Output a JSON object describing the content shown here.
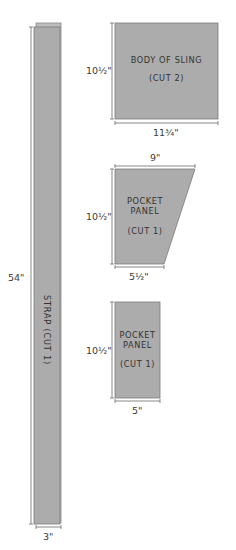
{
  "pieces": {
    "strap": {
      "label": "STRAP (CUT 1)",
      "length": "54\"",
      "width": "3\""
    },
    "body_of_sling": {
      "label_line1": "BODY OF SLING",
      "label_line2": "(CUT 2)",
      "height": "10½\"",
      "width": "11¾\""
    },
    "pocket_panel_trapezoid": {
      "label_line1": "POCKET",
      "label_line2": "PANEL",
      "label_line3": "(CUT 1)",
      "height": "10½\"",
      "top_width": "9\"",
      "bottom_width": "5½\""
    },
    "pocket_panel_rect": {
      "label_line1": "POCKET",
      "label_line2": "PANEL",
      "label_line3": "(CUT 1)",
      "height": "10½\"",
      "width": "5\""
    }
  },
  "colors": {
    "piece_fill": "#acacac",
    "dimension_line": "#6a6a6a",
    "text": "#333333"
  }
}
